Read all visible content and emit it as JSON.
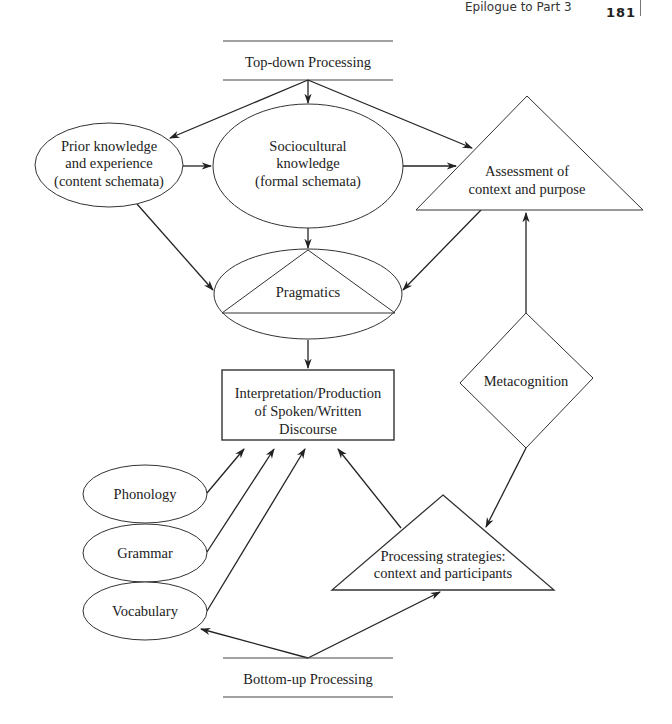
{
  "page_header": {
    "running_title": "Epilogue to Part 3",
    "page_number": "181"
  },
  "diagram": {
    "top_band": {
      "label": "Top-down Processing"
    },
    "bottom_band": {
      "label": "Bottom-up Processing"
    },
    "nodes": {
      "prior_knowledge": {
        "lines": [
          "Prior knowledge",
          "and experience",
          "(content schemata)"
        ],
        "shape": "ellipse"
      },
      "sociocultural": {
        "lines": [
          "Sociocultural",
          "knowledge",
          "(formal schemata)"
        ],
        "shape": "ellipse"
      },
      "assessment": {
        "lines": [
          "Assessment of",
          "context and purpose"
        ],
        "shape": "triangle"
      },
      "pragmatics": {
        "label": "Pragmatics",
        "shape": "ellipse-with-triangle"
      },
      "interpretation": {
        "lines": [
          "Interpretation/Production",
          "of Spoken/Written",
          "Discourse"
        ],
        "shape": "rectangle"
      },
      "metacognition": {
        "label": "Metacognition",
        "shape": "diamond"
      },
      "phonology": {
        "label": "Phonology",
        "shape": "ellipse"
      },
      "grammar": {
        "label": "Grammar",
        "shape": "ellipse"
      },
      "vocabulary": {
        "label": "Vocabulary",
        "shape": "ellipse"
      },
      "processing_strategies": {
        "lines": [
          "Processing strategies:",
          "context and participants"
        ],
        "shape": "triangle"
      }
    },
    "edges": [
      {
        "from": "Top-down Processing",
        "to": "Prior knowledge and experience"
      },
      {
        "from": "Top-down Processing",
        "to": "Sociocultural knowledge"
      },
      {
        "from": "Top-down Processing",
        "to": "Assessment of context and purpose"
      },
      {
        "from": "Prior knowledge and experience",
        "to": "Sociocultural knowledge"
      },
      {
        "from": "Sociocultural knowledge",
        "to": "Assessment of context and purpose"
      },
      {
        "from": "Prior knowledge and experience",
        "to": "Pragmatics"
      },
      {
        "from": "Sociocultural knowledge",
        "to": "Pragmatics"
      },
      {
        "from": "Assessment of context and purpose",
        "to": "Pragmatics"
      },
      {
        "from": "Pragmatics",
        "to": "Interpretation/Production of Spoken/Written Discourse"
      },
      {
        "from": "Metacognition",
        "to": "Assessment of context and purpose"
      },
      {
        "from": "Metacognition",
        "to": "Processing strategies"
      },
      {
        "from": "Phonology",
        "to": "Interpretation/Production of Spoken/Written Discourse"
      },
      {
        "from": "Grammar",
        "to": "Interpretation/Production of Spoken/Written Discourse"
      },
      {
        "from": "Vocabulary",
        "to": "Interpretation/Production of Spoken/Written Discourse"
      },
      {
        "from": "Processing strategies",
        "to": "Interpretation/Production of Spoken/Written Discourse"
      },
      {
        "from": "Bottom-up Processing",
        "to": "Vocabulary"
      },
      {
        "from": "Bottom-up Processing",
        "to": "Processing strategies"
      }
    ]
  }
}
